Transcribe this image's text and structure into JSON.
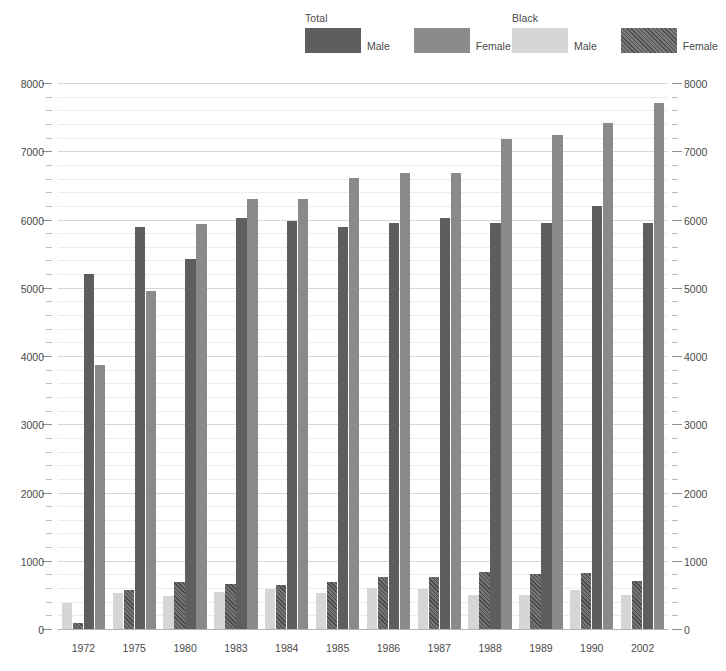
{
  "legend": {
    "groups": [
      {
        "title": "Total",
        "items": [
          {
            "label": "Male",
            "swatch": "total-male-swatch",
            "color": "#5e5e5e"
          },
          {
            "label": "Female",
            "swatch": "total-female-swatch",
            "color": "#8b8b8b"
          }
        ]
      },
      {
        "title": "Black",
        "items": [
          {
            "label": "Male",
            "swatch": "black-male-swatch",
            "color": "#d6d6d6"
          },
          {
            "label": "Female",
            "swatch": "black-female-swatch",
            "color": "#6b6b6b"
          }
        ]
      }
    ]
  },
  "chart_data": {
    "type": "bar",
    "title": "",
    "subtitle": "",
    "xlabel": "",
    "ylabel": "",
    "ylim": [
      0,
      8000
    ],
    "ytick_step": 1000,
    "yminor_step": 200,
    "grid": true,
    "dual_y_axis": true,
    "legend_position": "top",
    "categories": [
      "1972",
      "1975",
      "1980",
      "1983",
      "1984",
      "1985",
      "1986",
      "1987",
      "1988",
      "1989",
      "1990",
      "2002"
    ],
    "ytick_labels": [
      "0",
      "1000",
      "2000",
      "3000",
      "4000",
      "5000",
      "6000",
      "7000",
      "8000"
    ],
    "bar_order": [
      "Black Male",
      "Black Female",
      "Total Male",
      "Total Female"
    ],
    "series": [
      {
        "name": "Black Male",
        "key": "bm",
        "color": "#d6d6d6",
        "pattern": "solid",
        "values": [
          390,
          545,
          500,
          560,
          600,
          540,
          610,
          600,
          520,
          520,
          590,
          520
        ]
      },
      {
        "name": "Black Female",
        "key": "bf",
        "color": "#636363",
        "pattern": "diagonal-hatch",
        "values": [
          110,
          580,
          700,
          680,
          665,
          700,
          775,
          770,
          855,
          820,
          830,
          715
        ]
      },
      {
        "name": "Total Male",
        "key": "tm",
        "color": "#5e5e5e",
        "pattern": "solid",
        "values": [
          5220,
          5910,
          5440,
          6040,
          6000,
          5910,
          5970,
          6040,
          5970,
          5970,
          6210,
          5970
        ]
      },
      {
        "name": "Total Female",
        "key": "tf",
        "color": "#8a8a8a",
        "pattern": "solid",
        "values": [
          3880,
          4970,
          5950,
          6320,
          6310,
          6630,
          6700,
          6700,
          7190,
          7250,
          7430,
          7720
        ]
      }
    ]
  }
}
